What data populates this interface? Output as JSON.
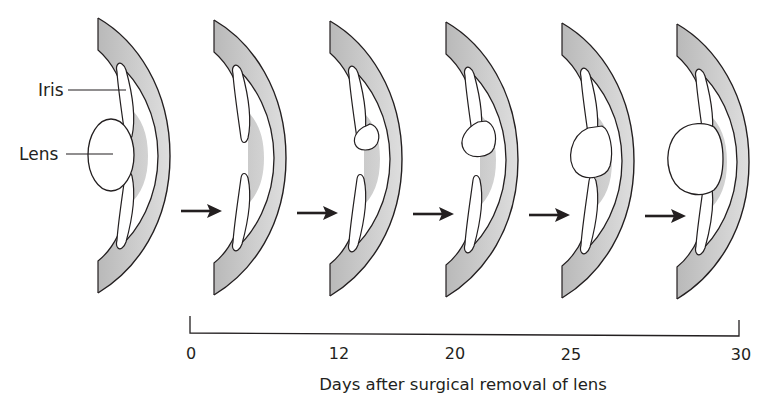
{
  "figure": {
    "labels": {
      "iris": "Iris",
      "lens": "Lens"
    },
    "stages": [
      {
        "day": "0",
        "lens_state": "intact lens (before removal)",
        "lens_size": "full"
      },
      {
        "day": "0",
        "lens_state": "lens removed",
        "lens_size": "none"
      },
      {
        "day": "12",
        "lens_state": "small vesicle budding from dorsal iris tip",
        "lens_size": "small"
      },
      {
        "day": "20",
        "lens_state": "lens vesicle enlarging",
        "lens_size": "medium"
      },
      {
        "day": "25",
        "lens_state": "lens growing",
        "lens_size": "large"
      },
      {
        "day": "30",
        "lens_state": "regenerated lens",
        "lens_size": "full"
      }
    ],
    "timeline": {
      "ticks": [
        "0",
        "12",
        "20",
        "25",
        "30"
      ],
      "caption": "Days after surgical removal of lens"
    },
    "colors": {
      "ink": "#231f20",
      "iris_fill": "#c8c8c8",
      "background": "#ffffff"
    }
  }
}
